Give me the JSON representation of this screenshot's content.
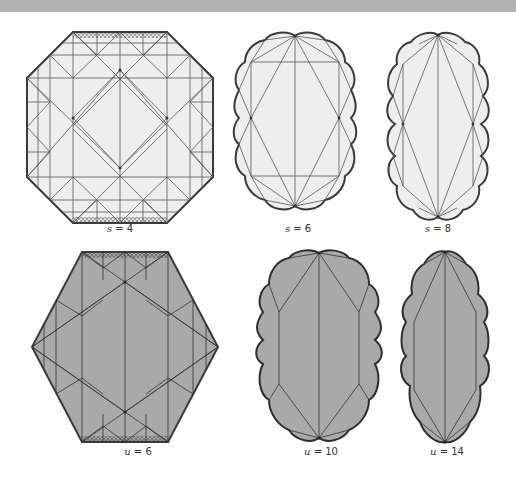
{
  "figure": {
    "colors": {
      "top_bar": "#b3b3b3",
      "light_fill": "#eeeeee",
      "dark_fill": "#a9a9a9",
      "stroke": "#3a3a3a"
    },
    "panels": [
      {
        "id": "s4",
        "var": "s",
        "eq": " = 4",
        "shape": "octagon",
        "fill": "light"
      },
      {
        "id": "s6",
        "var": "s",
        "eq": " = 6",
        "shape": "blob-wide",
        "fill": "light"
      },
      {
        "id": "s8",
        "var": "s",
        "eq": " = 8",
        "shape": "blob-narrow",
        "fill": "light"
      },
      {
        "id": "u6",
        "var": "u",
        "eq": " = 6",
        "shape": "hexagon",
        "fill": "dark"
      },
      {
        "id": "u10",
        "var": "u",
        "eq": " = 10",
        "shape": "blob-wide",
        "fill": "dark"
      },
      {
        "id": "u14",
        "var": "u",
        "eq": " = 14",
        "shape": "blob-narrow",
        "fill": "dark"
      }
    ]
  }
}
